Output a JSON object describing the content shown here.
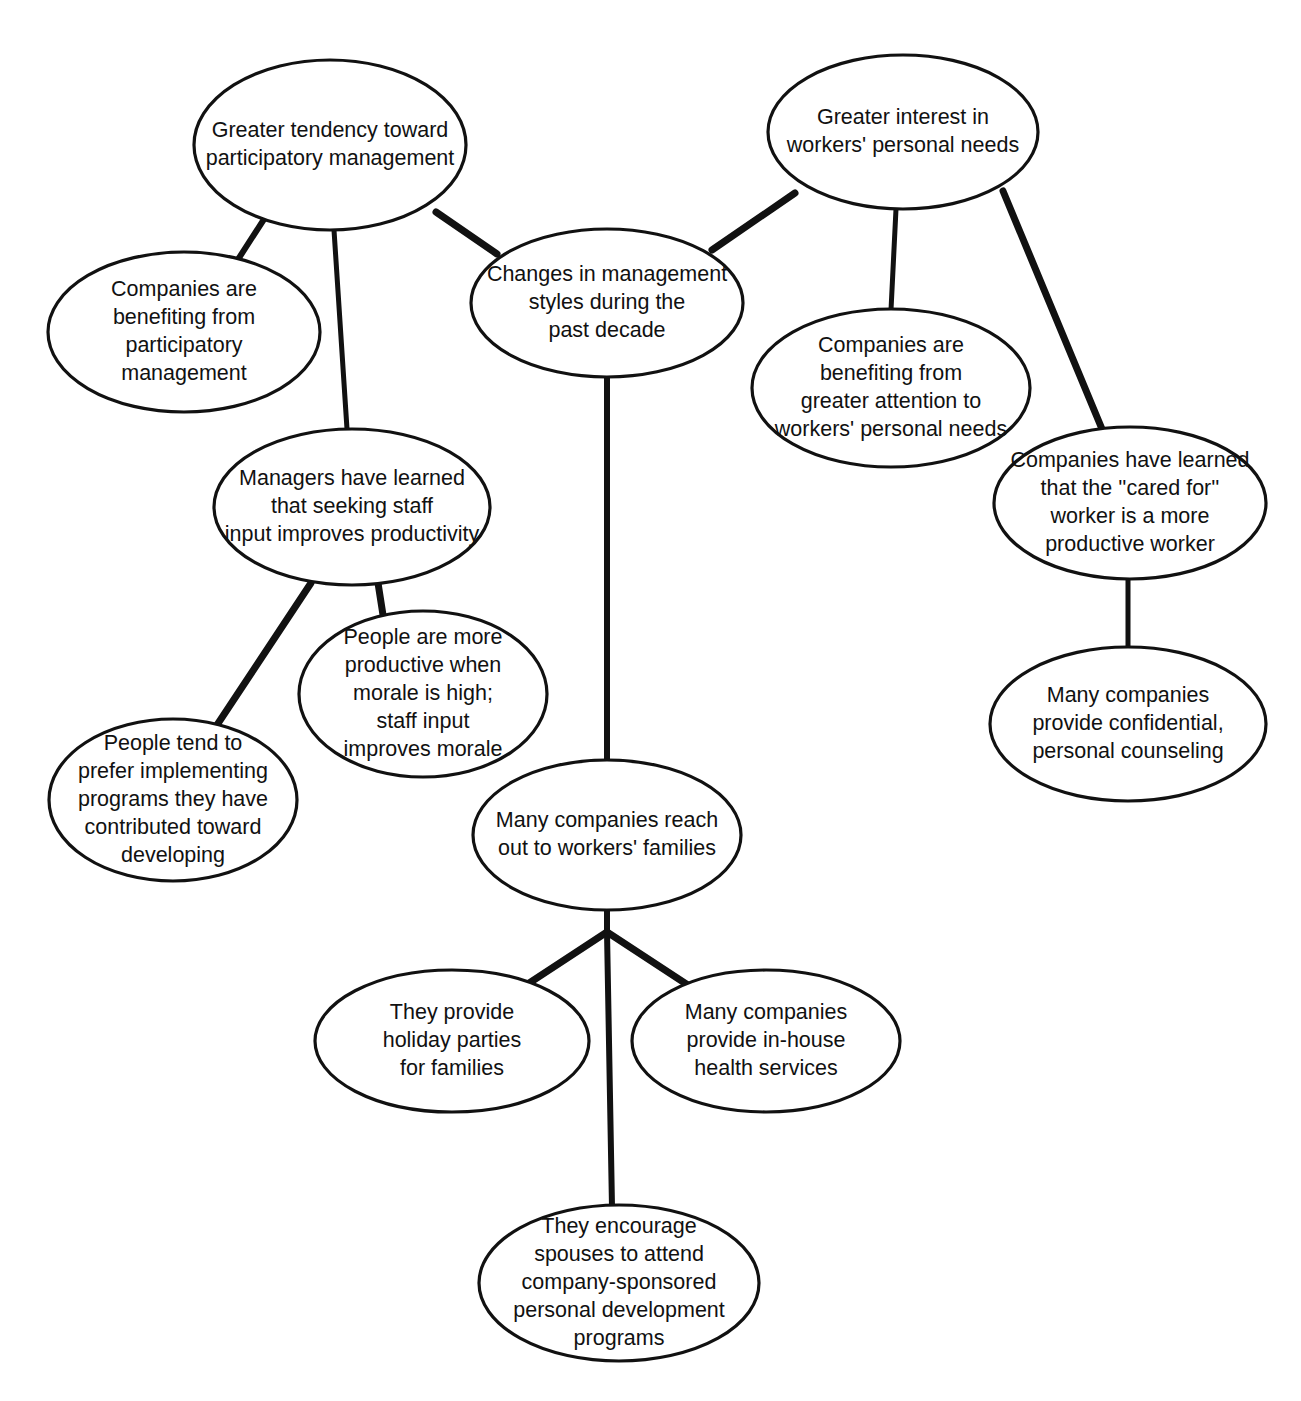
{
  "document": {
    "title_fragment": "",
    "type": "concept-map",
    "background_color": "#ffffff",
    "line_color": "#111111",
    "text_color": "#111111"
  },
  "diagram": {
    "central_topic": "Changes in management styles during the past decade",
    "nodes": [
      {
        "id": "center",
        "lines": [
          "Changes in management",
          "styles during the",
          "past decade"
        ],
        "cx": 607,
        "cy": 303,
        "rx": 136,
        "ry": 74,
        "font_size": 22
      },
      {
        "id": "participatory",
        "lines": [
          "Greater tendency toward",
          "participatory management"
        ],
        "cx": 330,
        "cy": 145,
        "rx": 136,
        "ry": 85,
        "font_size": 22
      },
      {
        "id": "personal-needs",
        "lines": [
          "Greater interest in",
          "workers' personal needs"
        ],
        "cx": 903,
        "cy": 132,
        "rx": 135,
        "ry": 77,
        "font_size": 22
      },
      {
        "id": "companies-benefit-participatory",
        "lines": [
          "Companies are",
          "benefiting from",
          "participatory",
          "management"
        ],
        "cx": 184,
        "cy": 332,
        "rx": 136,
        "ry": 80,
        "font_size": 22
      },
      {
        "id": "managers-learned",
        "lines": [
          "Managers have learned",
          "that seeking staff",
          "input improves productivity"
        ],
        "cx": 352,
        "cy": 507,
        "rx": 138,
        "ry": 78,
        "font_size": 22
      },
      {
        "id": "companies-benefit-attention",
        "lines": [
          "Companies are",
          "benefiting from",
          "greater attention to",
          "workers' personal needs"
        ],
        "cx": 891,
        "cy": 388,
        "rx": 139,
        "ry": 79,
        "font_size": 22
      },
      {
        "id": "cared-for-worker",
        "lines": [
          "Companies have learned",
          "that the ''cared for''",
          "worker is a more",
          "productive worker"
        ],
        "cx": 1130,
        "cy": 503,
        "rx": 136,
        "ry": 76,
        "font_size": 22
      },
      {
        "id": "morale",
        "lines": [
          "People are more",
          "productive when",
          "morale is high;",
          "staff input",
          "improves morale"
        ],
        "cx": 423,
        "cy": 694,
        "rx": 124,
        "ry": 83,
        "font_size": 22
      },
      {
        "id": "prefer-implementing",
        "lines": [
          "People tend to",
          "prefer implementing",
          "programs they have",
          "contributed toward",
          "developing"
        ],
        "cx": 173,
        "cy": 800,
        "rx": 124,
        "ry": 81,
        "font_size": 22
      },
      {
        "id": "counseling",
        "lines": [
          "Many companies",
          "provide confidential,",
          "personal counseling"
        ],
        "cx": 1128,
        "cy": 724,
        "rx": 138,
        "ry": 77,
        "font_size": 22
      },
      {
        "id": "reach-out-families",
        "lines": [
          "Many companies reach",
          "out to workers' families"
        ],
        "cx": 607,
        "cy": 835,
        "rx": 134,
        "ry": 75,
        "font_size": 22
      },
      {
        "id": "holiday-parties",
        "lines": [
          "They provide",
          "holiday parties",
          "for families"
        ],
        "cx": 452,
        "cy": 1041,
        "rx": 137,
        "ry": 71,
        "font_size": 22
      },
      {
        "id": "health-services",
        "lines": [
          "Many companies",
          "provide in-house",
          "health services"
        ],
        "cx": 766,
        "cy": 1041,
        "rx": 134,
        "ry": 71,
        "font_size": 22
      },
      {
        "id": "spouses",
        "lines": [
          "They encourage",
          "spouses to attend",
          "company-sponsored",
          "personal development",
          "programs"
        ],
        "cx": 619,
        "cy": 1283,
        "rx": 140,
        "ry": 78,
        "font_size": 22
      }
    ],
    "edges": [
      {
        "id": "e-center-participatory",
        "from": "participatory",
        "to": "center",
        "x1": 436,
        "y1": 212,
        "x2": 497,
        "y2": 254,
        "width": 7
      },
      {
        "id": "e-center-personal-needs",
        "from": "personal-needs",
        "to": "center",
        "x1": 795,
        "y1": 193,
        "x2": 712,
        "y2": 250,
        "width": 7
      },
      {
        "id": "e-participatory-benefit",
        "from": "participatory",
        "to": "companies-benefit-participatory",
        "x1": 268,
        "y1": 213,
        "x2": 237,
        "y2": 261,
        "width": 6
      },
      {
        "id": "e-participatory-managers",
        "from": "participatory",
        "to": "managers-learned",
        "x1": 334,
        "y1": 230,
        "x2": 347,
        "y2": 429,
        "width": 5
      },
      {
        "id": "e-personal-benefit",
        "from": "personal-needs",
        "to": "companies-benefit-attention",
        "x1": 896,
        "y1": 209,
        "x2": 891,
        "y2": 310,
        "width": 5
      },
      {
        "id": "e-personal-cared",
        "from": "personal-needs",
        "to": "cared-for-worker",
        "x1": 1003,
        "y1": 191,
        "x2": 1102,
        "y2": 429,
        "width": 7
      },
      {
        "id": "e-managers-prefer",
        "from": "managers-learned",
        "to": "prefer-implementing",
        "x1": 311,
        "y1": 583,
        "x2": 217,
        "y2": 725,
        "width": 7
      },
      {
        "id": "e-managers-morale",
        "from": "managers-learned",
        "to": "morale",
        "x1": 378,
        "y1": 583,
        "x2": 383,
        "y2": 615,
        "width": 7
      },
      {
        "id": "e-cared-counseling",
        "from": "cared-for-worker",
        "to": "counseling",
        "x1": 1128,
        "y1": 579,
        "x2": 1128,
        "y2": 648,
        "width": 5
      },
      {
        "id": "e-center-families",
        "from": "center",
        "to": "reach-out-families",
        "x1": 607,
        "y1": 377,
        "x2": 607,
        "y2": 761,
        "width": 6
      },
      {
        "id": "e-families-junction",
        "from": "reach-out-families",
        "to": "junction",
        "x1": 607,
        "y1": 910,
        "x2": 607,
        "y2": 932,
        "width": 6
      },
      {
        "id": "e-junction-holiday",
        "from": "junction",
        "to": "holiday-parties",
        "x1": 607,
        "y1": 932,
        "x2": 514,
        "y2": 993,
        "width": 7
      },
      {
        "id": "e-junction-health",
        "from": "junction",
        "to": "health-services",
        "x1": 607,
        "y1": 932,
        "x2": 700,
        "y2": 993,
        "width": 7
      },
      {
        "id": "e-junction-spouses",
        "from": "junction",
        "to": "spouses",
        "x1": 607,
        "y1": 932,
        "x2": 612,
        "y2": 1207,
        "width": 6
      }
    ]
  }
}
